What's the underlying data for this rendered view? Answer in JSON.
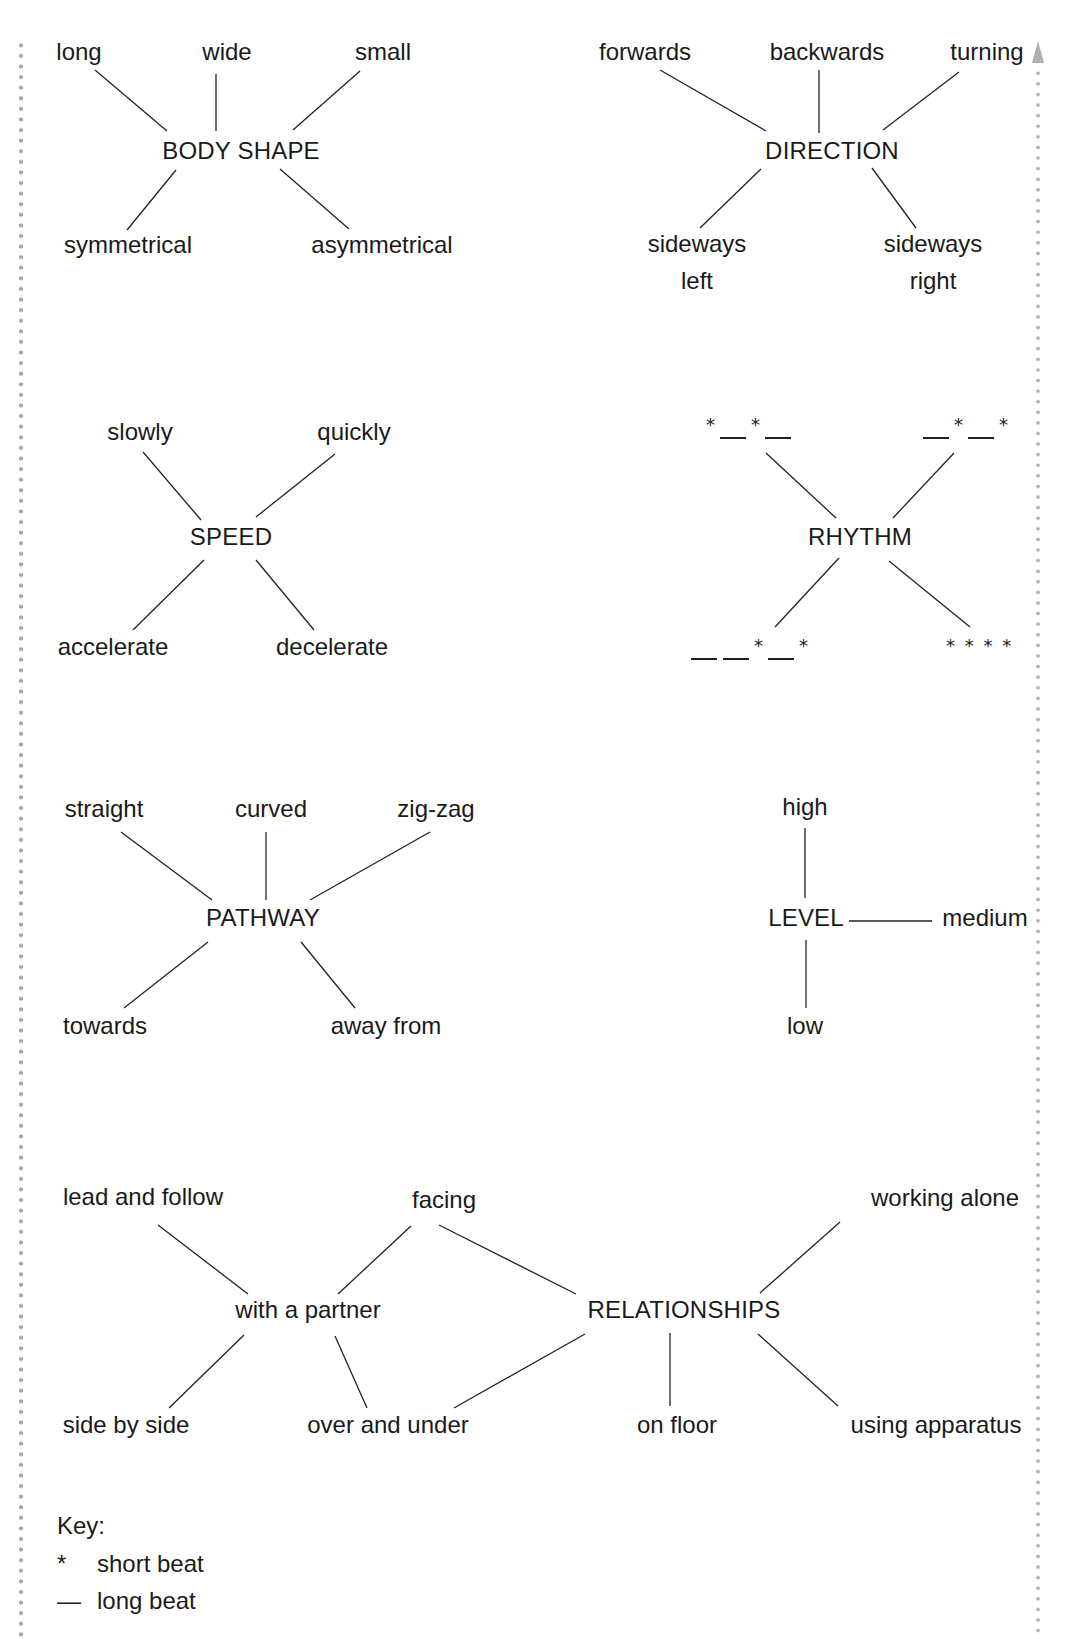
{
  "diagrams": {
    "body_shape": {
      "hub": "BODY SHAPE",
      "top": [
        "long",
        "wide",
        "small"
      ],
      "bottom": [
        "symmetrical",
        "asymmetrical"
      ]
    },
    "direction": {
      "hub": "DIRECTION",
      "top": [
        "forwards",
        "backwards",
        "turning"
      ],
      "bottom_left": [
        "sideways",
        "left"
      ],
      "bottom_right": [
        "sideways",
        "right"
      ]
    },
    "speed": {
      "hub": "SPEED",
      "top": [
        "slowly",
        "quickly"
      ],
      "bottom": [
        "accelerate",
        "decelerate"
      ]
    },
    "rhythm": {
      "hub": "RHYTHM",
      "patterns": {
        "top_left": "* — * —",
        "top_right": "— * — *",
        "bottom_left": "— — * — *",
        "bottom_right": "* * * *"
      }
    },
    "pathway": {
      "hub": "PATHWAY",
      "top": [
        "straight",
        "curved",
        "zig-zag"
      ],
      "bottom": [
        "towards",
        "away from"
      ]
    },
    "level": {
      "hub": "LEVEL",
      "top": "high",
      "right": "medium",
      "bottom": "low"
    },
    "relationships": {
      "hub": "RELATIONSHIPS",
      "sub_hub": "with a partner",
      "partner_items": [
        "lead and follow",
        "facing",
        "side by side",
        "over and under"
      ],
      "items": [
        "working alone",
        "on floor",
        "using apparatus"
      ]
    }
  },
  "key": {
    "title": "Key:",
    "entries": [
      {
        "symbol": "*",
        "label": "short beat"
      },
      {
        "symbol": "—",
        "label": "long beat"
      }
    ]
  }
}
